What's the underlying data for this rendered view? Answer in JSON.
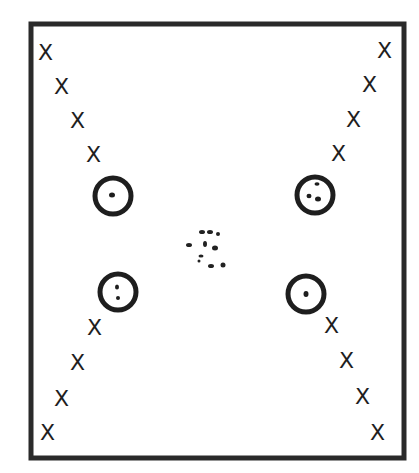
{
  "diagram": {
    "title": "",
    "border": {
      "x": 29,
      "y": 22,
      "width": 377,
      "height": 438,
      "color": "#2a2a2a"
    },
    "left_top_marks": [
      {
        "label": "X",
        "x": 46,
        "y": 52
      },
      {
        "label": "X",
        "x": 62,
        "y": 86
      },
      {
        "label": "X",
        "x": 78,
        "y": 120
      },
      {
        "label": "X",
        "x": 94,
        "y": 154
      }
    ],
    "right_top_marks": [
      {
        "label": "X",
        "x": 386,
        "y": 50
      },
      {
        "label": "X",
        "x": 370,
        "y": 84
      },
      {
        "label": "X",
        "x": 354,
        "y": 119
      },
      {
        "label": "X",
        "x": 339,
        "y": 153
      }
    ],
    "left_bottom_marks": [
      {
        "label": "X",
        "x": 95,
        "y": 327
      },
      {
        "label": "X",
        "x": 78,
        "y": 362
      },
      {
        "label": "X",
        "x": 62,
        "y": 398
      },
      {
        "label": "X",
        "x": 48,
        "y": 432
      }
    ],
    "right_bottom_marks": [
      {
        "label": "X",
        "x": 332,
        "y": 325
      },
      {
        "label": "X",
        "x": 347,
        "y": 360
      },
      {
        "label": "X",
        "x": 363,
        "y": 396
      },
      {
        "label": "X",
        "x": 378,
        "y": 432
      }
    ],
    "circles": [
      {
        "name": "circle-upper-left",
        "cx": 113,
        "cy": 196,
        "r": 19,
        "dots": 1
      },
      {
        "name": "circle-upper-right",
        "cx": 315,
        "cy": 195,
        "r": 19,
        "dots": 3
      },
      {
        "name": "circle-lower-left",
        "cx": 118,
        "cy": 292,
        "r": 19,
        "dots": 2
      },
      {
        "name": "circle-lower-right",
        "cx": 306,
        "cy": 294,
        "r": 19,
        "dots": 1
      }
    ],
    "center_cluster": {
      "cx": 207,
      "cy": 248,
      "dot_count": 10,
      "color": "#222222"
    }
  }
}
